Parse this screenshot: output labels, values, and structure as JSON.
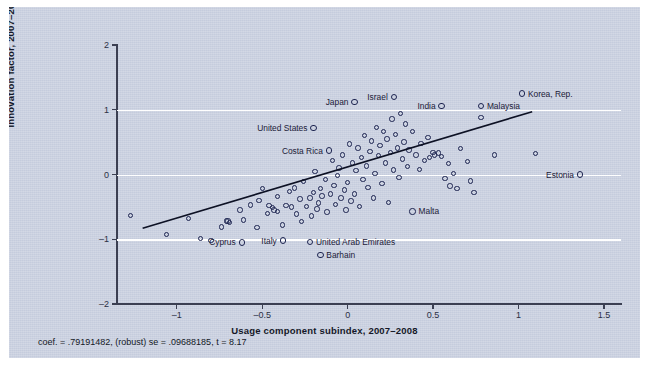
{
  "figure": {
    "background_color": "#c5ccdd",
    "border_color": "#ffffff",
    "marker_color": "#1d2450",
    "gridline_color": "#ffffff",
    "axis_color": "#3b3f52",
    "footnote": "coef. = .79191482, (robust) se = .09688185, t = 8.17"
  },
  "chart_data": {
    "type": "scatter",
    "title": "",
    "xlabel": "Usage component subindex, 2007–2008",
    "ylabel": "Innovation factor, 2007–2008",
    "xlim": [
      -1.35,
      1.6
    ],
    "ylim": [
      -2,
      2
    ],
    "xticks": [
      -1,
      -0.5,
      0,
      0.5,
      1,
      1.5
    ],
    "xticklabels": [
      "–1",
      "–0.5",
      "0",
      "0.5",
      "1",
      "1.5"
    ],
    "yticks": [
      -2,
      -1,
      0,
      1,
      2
    ],
    "yticklabels": [
      "–2",
      "–1",
      "0",
      "1",
      "2"
    ],
    "grid": "horizontal gridlines at y = -1, 0, 1 (white)",
    "legend": "none",
    "fit_line": {
      "kind": "linear regression",
      "slope": 0.79191482,
      "robust_se": 0.09688185,
      "t": 8.17,
      "x_start": -1.2,
      "y_start": -0.83,
      "x_end": 1.08,
      "y_end": 0.97
    },
    "annotated_points": [
      {
        "label": "Japan",
        "x": 0.04,
        "y": 1.12,
        "label_side": "left"
      },
      {
        "label": "Israel",
        "x": 0.27,
        "y": 1.2,
        "label_side": "left"
      },
      {
        "label": "India",
        "x": 0.55,
        "y": 1.06,
        "label_side": "left"
      },
      {
        "label": "Malaysia",
        "x": 0.78,
        "y": 1.06,
        "label_side": "right"
      },
      {
        "label": "Korea, Rep.",
        "x": 1.02,
        "y": 1.25,
        "label_side": "right"
      },
      {
        "label": "United States",
        "x": -0.2,
        "y": 0.72,
        "label_side": "left"
      },
      {
        "label": "Costa Rica",
        "x": -0.11,
        "y": 0.37,
        "label_side": "left"
      },
      {
        "label": "Estonia",
        "x": 1.36,
        "y": 0.0,
        "label_side": "left"
      },
      {
        "label": "Malta",
        "x": 0.38,
        "y": -0.57,
        "label_side": "right"
      },
      {
        "label": "Cyprus",
        "x": -0.62,
        "y": -1.05,
        "label_side": "left"
      },
      {
        "label": "Italy",
        "x": -0.38,
        "y": -1.02,
        "label_side": "left"
      },
      {
        "label": "United Arab Emirates",
        "x": -0.22,
        "y": -1.04,
        "label_side": "right"
      },
      {
        "label": "Barhain",
        "x": -0.16,
        "y": -1.24,
        "label_side": "right"
      }
    ],
    "points": [
      [
        -1.27,
        -0.63
      ],
      [
        -1.06,
        -0.93
      ],
      [
        -0.93,
        -0.68
      ],
      [
        -0.86,
        -0.99
      ],
      [
        -0.8,
        -1.02
      ],
      [
        -0.74,
        -0.81
      ],
      [
        -0.71,
        -0.72
      ],
      [
        -0.7,
        -0.72
      ],
      [
        -0.69,
        -0.74
      ],
      [
        -0.63,
        -0.55
      ],
      [
        -0.61,
        -0.7
      ],
      [
        -0.57,
        -0.47
      ],
      [
        -0.53,
        -0.82
      ],
      [
        -0.52,
        -0.4
      ],
      [
        -0.5,
        -0.22
      ],
      [
        -0.47,
        -0.6
      ],
      [
        -0.46,
        -0.48
      ],
      [
        -0.44,
        -0.51
      ],
      [
        -0.43,
        -0.55
      ],
      [
        -0.41,
        -0.57
      ],
      [
        -0.41,
        -0.34
      ],
      [
        -0.38,
        -0.78
      ],
      [
        -0.36,
        -0.48
      ],
      [
        -0.34,
        -0.26
      ],
      [
        -0.33,
        -0.5
      ],
      [
        -0.31,
        -0.21
      ],
      [
        -0.3,
        -0.61
      ],
      [
        -0.28,
        -0.38
      ],
      [
        -0.27,
        -0.73
      ],
      [
        -0.26,
        -0.11
      ],
      [
        -0.24,
        -0.49
      ],
      [
        -0.22,
        -0.36
      ],
      [
        -0.21,
        -0.64
      ],
      [
        -0.2,
        -0.28
      ],
      [
        -0.19,
        0.05
      ],
      [
        -0.18,
        -0.53
      ],
      [
        -0.17,
        -0.44
      ],
      [
        -0.16,
        -0.22
      ],
      [
        -0.15,
        -0.33
      ],
      [
        -0.13,
        -0.08
      ],
      [
        -0.12,
        -0.58
      ],
      [
        -0.1,
        -0.3
      ],
      [
        -0.09,
        0.22
      ],
      [
        -0.08,
        -0.17
      ],
      [
        -0.07,
        -0.46
      ],
      [
        -0.06,
        -0.02
      ],
      [
        -0.05,
        0.1
      ],
      [
        -0.04,
        -0.36
      ],
      [
        -0.03,
        0.3
      ],
      [
        -0.02,
        -0.24
      ],
      [
        -0.01,
        -0.55
      ],
      [
        0.0,
        -0.12
      ],
      [
        0.01,
        0.47
      ],
      [
        0.02,
        -0.41
      ],
      [
        0.03,
        0.18
      ],
      [
        0.04,
        -0.3
      ],
      [
        0.05,
        0.06
      ],
      [
        0.06,
        0.41
      ],
      [
        0.07,
        -0.49
      ],
      [
        0.08,
        0.26
      ],
      [
        0.09,
        -0.08
      ],
      [
        0.1,
        0.6
      ],
      [
        0.11,
        0.13
      ],
      [
        0.12,
        -0.2
      ],
      [
        0.13,
        0.36
      ],
      [
        0.14,
        0.52
      ],
      [
        0.15,
        -0.36
      ],
      [
        0.16,
        0.02
      ],
      [
        0.17,
        0.73
      ],
      [
        0.18,
        0.29
      ],
      [
        0.19,
        0.45
      ],
      [
        0.2,
        -0.14
      ],
      [
        0.21,
        0.66
      ],
      [
        0.22,
        0.18
      ],
      [
        0.23,
        0.55
      ],
      [
        0.24,
        -0.43
      ],
      [
        0.25,
        0.34
      ],
      [
        0.26,
        0.86
      ],
      [
        0.27,
        0.07
      ],
      [
        0.28,
        0.62
      ],
      [
        0.29,
        0.41
      ],
      [
        0.3,
        -0.05
      ],
      [
        0.31,
        0.94
      ],
      [
        0.32,
        0.24
      ],
      [
        0.33,
        0.5
      ],
      [
        0.34,
        0.78
      ],
      [
        0.35,
        0.12
      ],
      [
        0.36,
        0.38
      ],
      [
        0.38,
        0.66
      ],
      [
        0.4,
        0.3
      ],
      [
        0.42,
        0.08
      ],
      [
        0.43,
        0.48
      ],
      [
        0.45,
        0.22
      ],
      [
        0.47,
        0.57
      ],
      [
        0.48,
        0.26
      ],
      [
        0.5,
        0.34
      ],
      [
        0.51,
        0.3
      ],
      [
        0.53,
        0.33
      ],
      [
        0.55,
        0.28
      ],
      [
        0.57,
        -0.06
      ],
      [
        0.59,
        0.17
      ],
      [
        0.6,
        -0.18
      ],
      [
        0.62,
        0.02
      ],
      [
        0.64,
        -0.22
      ],
      [
        0.66,
        0.4
      ],
      [
        0.7,
        0.2
      ],
      [
        0.72,
        -0.1
      ],
      [
        0.74,
        -0.28
      ],
      [
        0.78,
        0.88
      ],
      [
        0.86,
        0.3
      ],
      [
        1.1,
        0.32
      ]
    ]
  }
}
